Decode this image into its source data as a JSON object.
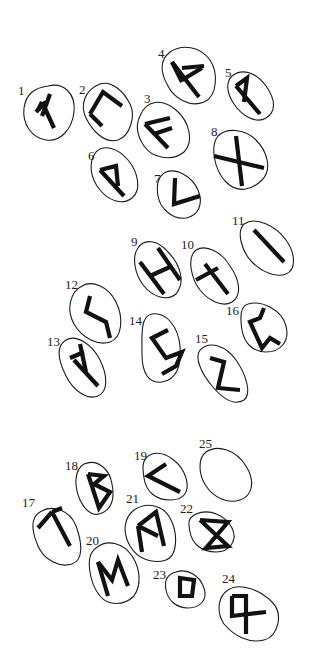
{
  "figure": {
    "background": "#ffffff",
    "ink_color": "#111111"
  },
  "stones": [
    {
      "number": "1",
      "rune": "fehu",
      "label_xy": [
        18,
        95
      ],
      "outline": "M48,86 C64,82 76,94 74,112 C72,130 60,142 46,140 C32,138 22,124 24,108 C26,94 34,88 48,86 Z",
      "strokes": [
        "M42,102 L54,128",
        "M42,102 L38,110",
        "M46,102 L36,112",
        "M50,94 L42,116"
      ]
    },
    {
      "number": "2",
      "rune": "uruz",
      "label_xy": [
        79,
        94
      ],
      "outline": "M100,84 C112,80 124,92 130,104 C136,116 130,136 118,140 C104,144 92,130 86,118 C80,106 84,90 100,84 Z",
      "strokes": [
        "M90,114 L103,92 L122,106",
        "M90,114 L102,126"
      ]
    },
    {
      "number": "3",
      "rune": "ansuz",
      "label_xy": [
        144,
        103
      ],
      "outline": "M140,116 C146,100 162,98 176,110 C190,122 194,142 184,152 C172,162 152,158 144,146 C136,134 136,124 140,116 Z",
      "strokes": [
        "M145,124 L168,148",
        "M145,124 L170,118",
        "M154,134 L172,128"
      ]
    },
    {
      "number": "4",
      "rune": "raidho",
      "label_xy": [
        158,
        58
      ],
      "outline": "M170,52 C182,44 200,46 210,60 C218,72 218,96 204,102 C190,108 174,98 168,86 C160,72 160,60 170,52 Z",
      "strokes": [
        "M172,62 L199,97",
        "M172,62 L182,82",
        "M182,68 L204,66",
        "M182,80 L202,68"
      ]
    },
    {
      "number": "5",
      "rune": "kenaz_alt",
      "label_xy": [
        225,
        77
      ],
      "outline": "M232,76 C242,68 256,72 266,86 C276,100 276,112 266,118 C256,124 242,116 234,104 C226,92 226,82 232,76 Z",
      "strokes": [
        "M236,86 L260,114",
        "M236,86 L247,78 L244,102"
      ]
    },
    {
      "number": "6",
      "rune": "wunjo_alt",
      "label_xy": [
        88,
        160
      ],
      "outline": "M96,152 C104,144 118,148 128,160 C138,172 142,190 132,198 C122,206 108,200 100,190 C90,178 88,162 96,152 Z",
      "strokes": [
        "M100,170 L124,196",
        "M100,170 L116,166 L118,186"
      ]
    },
    {
      "number": "7",
      "rune": "kenaz",
      "label_xy": [
        154,
        183
      ],
      "outline": "M166,172 C176,168 192,176 198,190 C204,204 198,216 186,218 C172,220 160,208 158,196 C156,184 158,176 166,172 Z",
      "strokes": [
        "M175,178 L174,204 L200,196"
      ]
    },
    {
      "number": "8",
      "rune": "gebo",
      "label_xy": [
        211,
        136
      ],
      "outline": "M218,136 C226,128 244,128 256,140 C268,152 272,170 262,180 C252,190 238,194 226,182 C214,170 210,146 218,136 Z",
      "strokes": [
        "M236,136 L242,186",
        "M214,156 L264,168"
      ]
    },
    {
      "number": "9",
      "rune": "hagalaz",
      "label_xy": [
        131,
        246
      ],
      "outline": "M138,248 C144,238 158,240 168,252 C180,264 186,282 176,294 C166,302 152,296 144,286 C134,274 132,256 138,248 Z",
      "strokes": [
        "M158,248 L180,280",
        "M140,262 L164,294",
        "M150,276 L172,266"
      ]
    },
    {
      "number": "10",
      "rune": "nauthiz",
      "label_xy": [
        181,
        249
      ],
      "outline": "M196,250 C206,244 222,252 230,266 C240,280 242,296 232,302 C222,308 208,300 200,290 C192,280 186,258 196,250 Z",
      "strokes": [
        "M205,264 L228,294",
        "M196,280 L218,268"
      ]
    },
    {
      "number": "11",
      "rune": "isa",
      "label_xy": [
        232,
        225
      ],
      "outline": "M244,224 C256,216 276,226 286,240 C296,254 296,270 286,274 C276,278 262,272 252,262 C242,252 236,232 244,224 Z",
      "strokes": [
        "M254,230 L284,262"
      ]
    },
    {
      "number": "12",
      "rune": "jera_alt",
      "label_xy": [
        65,
        289
      ],
      "outline": "M82,286 C92,280 108,286 116,302 C124,318 122,338 110,342 C98,346 82,338 74,324 C66,310 70,292 82,286 Z",
      "strokes": [
        "M90,296 L86,312 L106,322 L110,338"
      ]
    },
    {
      "number": "13",
      "rune": "algiz",
      "label_xy": [
        47,
        346
      ],
      "outline": "M66,340 C76,334 92,344 100,360 C108,376 108,392 98,396 C88,400 74,392 66,376 C58,360 56,346 66,340 Z",
      "strokes": [
        "M74,360 L98,386",
        "M80,344 L86,372",
        "M70,358 L84,352"
      ]
    },
    {
      "number": "14",
      "rune": "eihwaz_alt",
      "label_xy": [
        129,
        325
      ],
      "outline": "M152,314 C166,312 178,326 180,346 C182,366 176,380 162,382 C148,384 142,372 142,354 C142,336 140,316 152,314 Z",
      "strokes": [
        "M168,330 L152,338 L166,358 L182,352 L176,366 L162,374"
      ]
    },
    {
      "number": "15",
      "rune": "sowilo_alt",
      "label_xy": [
        195,
        343
      ],
      "outline": "M200,350 C210,340 226,346 236,360 C246,374 252,394 244,400 C234,406 222,398 212,386 C202,374 194,358 200,350 Z",
      "strokes": [
        "M210,358 L224,362 L218,388 L240,390"
      ]
    },
    {
      "number": "16",
      "rune": "perthro",
      "label_xy": [
        226,
        315
      ],
      "outline": "M248,304 C262,300 282,310 286,326 C290,342 280,352 266,352 C252,352 244,342 242,330 C240,318 240,306 248,304 Z",
      "strokes": [
        "M264,308 L260,318 L250,322 L262,348 L270,338 L280,344"
      ]
    },
    {
      "number": "17",
      "rune": "tiwaz",
      "label_xy": [
        22,
        507
      ],
      "outline": "M40,512 C52,504 70,510 76,526 C82,542 84,560 72,564 C60,568 44,560 38,546 C32,532 30,518 40,512 Z",
      "strokes": [
        "M52,512 L70,546",
        "M52,512 L38,528",
        "M52,512 L62,508"
      ]
    },
    {
      "number": "18",
      "rune": "berkano",
      "label_xy": [
        65,
        470
      ],
      "outline": "M84,464 C98,458 110,470 112,484 C114,494 114,506 104,512 C94,518 86,512 80,500 C74,486 74,470 84,464 Z",
      "strokes": [
        "M88,474 L99,508 L110,492 L94,484 L104,476 L88,474"
      ]
    },
    {
      "number": "19",
      "rune": "kenaz_19",
      "label_xy": [
        134,
        460
      ],
      "outline": "M152,454 C166,450 182,464 186,478 C190,492 184,500 170,500 C156,500 146,492 144,478 C142,466 142,458 152,454 Z",
      "strokes": [
        "M166,464 L148,476 L180,492"
      ]
    },
    {
      "number": "20",
      "rune": "mannaz_alt",
      "label_xy": [
        86,
        545
      ],
      "outline": "M96,548 C108,538 124,544 132,556 C140,568 142,584 134,596 C124,606 108,606 100,596 C90,584 84,556 96,548 Z",
      "strokes": [
        "M98,562 L108,596",
        "M98,562 L112,580 L118,560 L128,586"
      ]
    },
    {
      "number": "21",
      "rune": "mannaz",
      "label_xy": [
        126,
        503
      ],
      "outline": "M134,510 C146,502 162,504 170,518 C178,532 178,556 166,560 C154,564 138,560 130,546 C122,532 124,518 134,510 Z",
      "strokes": [
        "M138,526 L142,552",
        "M138,526 L156,512 L164,546",
        "M138,526 L158,536"
      ]
    },
    {
      "number": "22",
      "rune": "dagaz_alt",
      "label_xy": [
        180,
        513
      ],
      "outline": "M196,514 C210,508 226,516 232,528 C238,540 230,552 216,552 C202,552 192,544 190,532 C188,522 188,518 196,514 Z",
      "strokes": [
        "M200,520 L228,522 L206,548 L228,546 L200,520"
      ]
    },
    {
      "number": "23",
      "rune": "ingwaz",
      "label_xy": [
        153,
        579
      ],
      "outline": "M176,572 C188,568 200,576 204,588 C208,600 200,608 188,608 C176,608 168,600 166,590 C164,580 168,574 176,572 Z",
      "strokes": [
        "M180,578 L194,580 L192,596 L180,596 Z"
      ]
    },
    {
      "number": "24",
      "rune": "othala",
      "label_xy": [
        222,
        583
      ],
      "outline": "M228,590 C240,582 260,590 272,602 C284,614 278,636 264,640 C250,644 234,636 224,624 C216,612 218,596 228,590 Z",
      "strokes": [
        "M232,596 L246,596 L246,634",
        "M232,596 L232,616 L266,612"
      ]
    },
    {
      "number": "25",
      "rune": "blank",
      "label_xy": [
        199,
        448
      ],
      "outline": "M206,452 C218,444 236,450 246,466 C256,482 252,496 240,500 C228,504 214,498 206,486 C198,474 198,458 206,452 Z",
      "strokes": []
    }
  ]
}
